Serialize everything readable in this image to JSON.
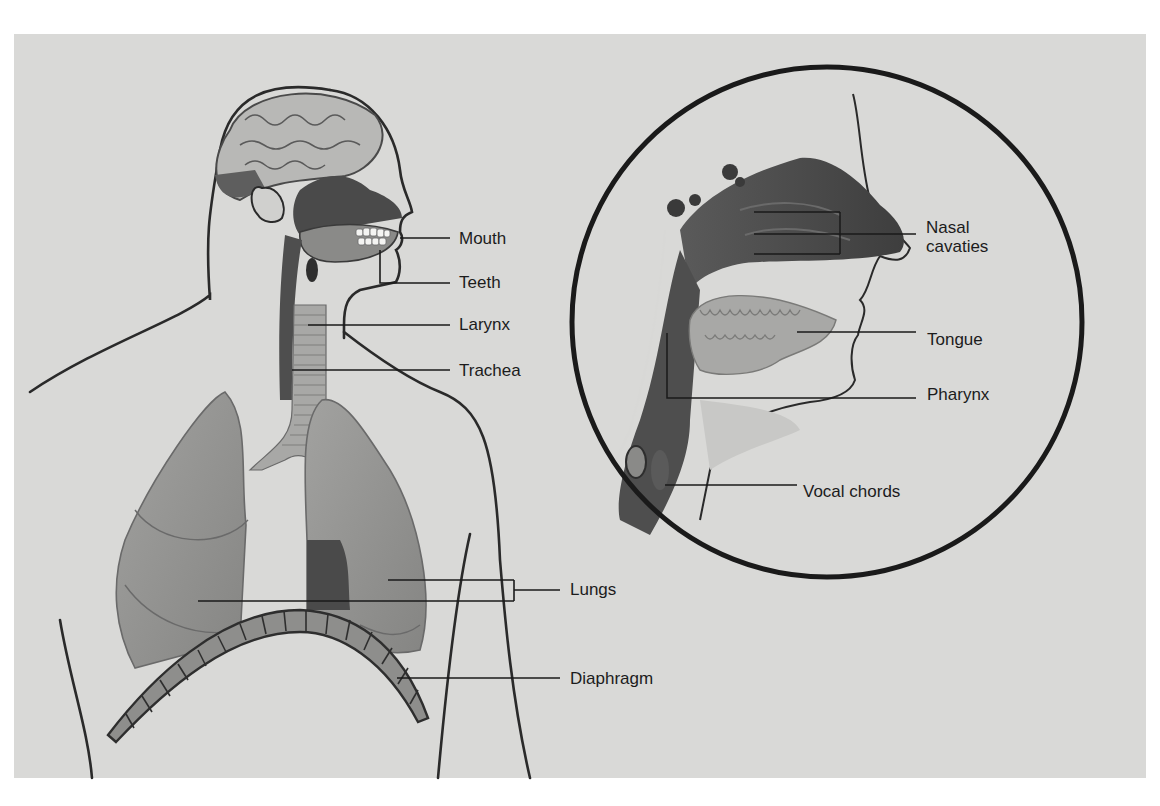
{
  "diagram": {
    "colors": {
      "background": "#d9d9d7",
      "page": "#ffffff",
      "ink": "#1c1c1c",
      "tissue_dark": "#4a4a4a",
      "tissue_mid": "#8a8a88",
      "tissue_light": "#b5b5b3"
    },
    "body_labels": [
      {
        "id": "mouth",
        "text": "Mouth",
        "x": 459,
        "y": 229
      },
      {
        "id": "teeth",
        "text": "Teeth",
        "x": 459,
        "y": 273
      },
      {
        "id": "larynx",
        "text": "Larynx",
        "x": 459,
        "y": 315
      },
      {
        "id": "trachea",
        "text": "Trachea",
        "x": 459,
        "y": 362
      },
      {
        "id": "lungs",
        "text": "Lungs",
        "x": 570,
        "y": 579
      },
      {
        "id": "diaphragm",
        "text": "Diaphragm",
        "x": 570,
        "y": 669
      }
    ],
    "inset_labels": [
      {
        "id": "nasal-cavaties",
        "text_line1": "Nasal",
        "text_line2": "cavaties",
        "x": 926,
        "y": 218
      },
      {
        "id": "tongue",
        "text": "Tongue",
        "x": 927,
        "y": 330
      },
      {
        "id": "pharynx",
        "text": "Pharynx",
        "x": 927,
        "y": 385
      },
      {
        "id": "vocal-chords",
        "text": "Vocal chords",
        "x": 803,
        "y": 482
      }
    ]
  }
}
